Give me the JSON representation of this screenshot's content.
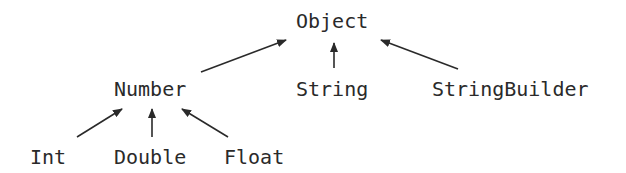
{
  "diagram": {
    "type": "class-hierarchy",
    "nodes": [
      {
        "id": "object",
        "label": "Object",
        "x": 296,
        "y": 10
      },
      {
        "id": "number",
        "label": "Number",
        "x": 114,
        "y": 78
      },
      {
        "id": "string",
        "label": "String",
        "x": 296,
        "y": 78
      },
      {
        "id": "stringbuilder",
        "label": "StringBuilder",
        "x": 432,
        "y": 78
      },
      {
        "id": "int",
        "label": "Int",
        "x": 30,
        "y": 146
      },
      {
        "id": "double",
        "label": "Double",
        "x": 114,
        "y": 146
      },
      {
        "id": "float",
        "label": "Float",
        "x": 224,
        "y": 146
      }
    ],
    "edges": [
      {
        "from": "number",
        "to": "object"
      },
      {
        "from": "string",
        "to": "object"
      },
      {
        "from": "stringbuilder",
        "to": "object"
      },
      {
        "from": "int",
        "to": "number"
      },
      {
        "from": "double",
        "to": "number"
      },
      {
        "from": "float",
        "to": "number"
      }
    ],
    "colors": {
      "stroke": "#2a2a2a",
      "text": "#2a2a2a",
      "background": "#ffffff"
    }
  }
}
